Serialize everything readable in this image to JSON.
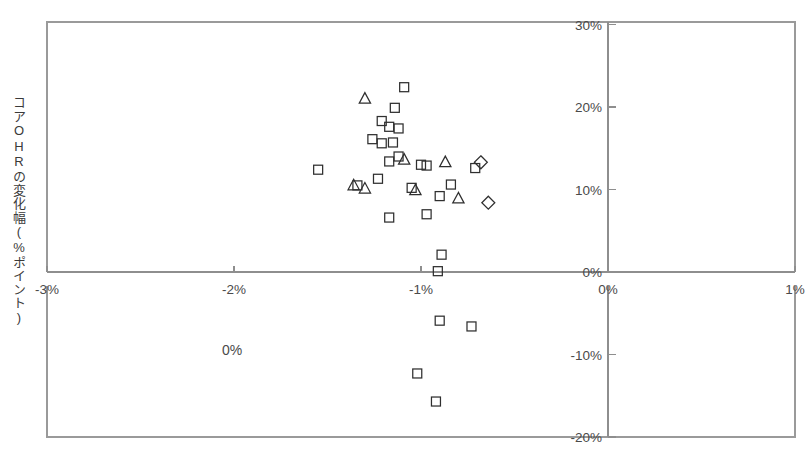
{
  "axes": {
    "ylabel": "コアOHRの変化幅(%ポイント)",
    "x_ticks": [
      "-3%",
      "-2%",
      "-1%",
      "0%",
      "1%"
    ],
    "y_ticks": [
      "30%",
      "20%",
      "10%",
      "0%",
      "-10%",
      "-20%"
    ]
  },
  "annotations": {
    "stray_zero": "0%"
  },
  "chart_data": {
    "type": "scatter",
    "title": "",
    "xlabel": "",
    "ylabel": "コアOHRの変化幅(%ポイント)",
    "xlim": [
      -3,
      1
    ],
    "ylim": [
      -20,
      30
    ],
    "xticks": [
      -3,
      -2,
      -1,
      0,
      1
    ],
    "yticks": [
      30,
      20,
      10,
      0,
      -10,
      -20
    ],
    "xtick_labels": [
      "-3%",
      "-2%",
      "-1%",
      "0%",
      "1%"
    ],
    "ytick_labels": [
      "30%",
      "20%",
      "10%",
      "0%",
      "-10%",
      "-20%"
    ],
    "grid": false,
    "legend": null,
    "y_axis_position": "right",
    "x_axis_position": "zero",
    "series": [
      {
        "name": "square",
        "marker": "square",
        "points": [
          [
            -1.09,
            22.4
          ],
          [
            -1.14,
            19.9
          ],
          [
            -1.21,
            18.3
          ],
          [
            -1.17,
            17.6
          ],
          [
            -1.12,
            17.4
          ],
          [
            -1.26,
            16.1
          ],
          [
            -1.21,
            15.6
          ],
          [
            -1.15,
            15.7
          ],
          [
            -1.12,
            14.0
          ],
          [
            -1.55,
            12.4
          ],
          [
            -1.17,
            13.4
          ],
          [
            -1.0,
            13.0
          ],
          [
            -0.97,
            12.9
          ],
          [
            -0.71,
            12.6
          ],
          [
            -1.34,
            10.5
          ],
          [
            -1.23,
            11.3
          ],
          [
            -1.05,
            10.2
          ],
          [
            -0.84,
            10.6
          ],
          [
            -0.9,
            9.2
          ],
          [
            -1.17,
            6.6
          ],
          [
            -0.97,
            7.0
          ],
          [
            -0.89,
            2.1
          ],
          [
            -0.91,
            0.1
          ],
          [
            -0.9,
            -5.9
          ],
          [
            -0.73,
            -6.6
          ],
          [
            -1.02,
            -12.3
          ],
          [
            -0.92,
            -15.7
          ]
        ]
      },
      {
        "name": "triangle",
        "marker": "triangle",
        "points": [
          [
            -1.3,
            21.0
          ],
          [
            -1.36,
            10.5
          ],
          [
            -1.3,
            10.1
          ],
          [
            -1.09,
            13.6
          ],
          [
            -0.87,
            13.3
          ],
          [
            -1.03,
            9.9
          ],
          [
            -0.8,
            8.9
          ]
        ]
      },
      {
        "name": "diamond",
        "marker": "diamond",
        "points": [
          [
            -0.68,
            13.3
          ],
          [
            -0.64,
            8.4
          ]
        ]
      }
    ]
  },
  "geometry": {
    "x0_px": 47,
    "x_per_unit_px": 187,
    "x_min_unit": -3,
    "y0_px": 272,
    "y_per_unit_px": 8.25,
    "frame_left": 47,
    "frame_right": 795,
    "frame_top": 22,
    "frame_bottom": 437,
    "marker_size": 9
  }
}
